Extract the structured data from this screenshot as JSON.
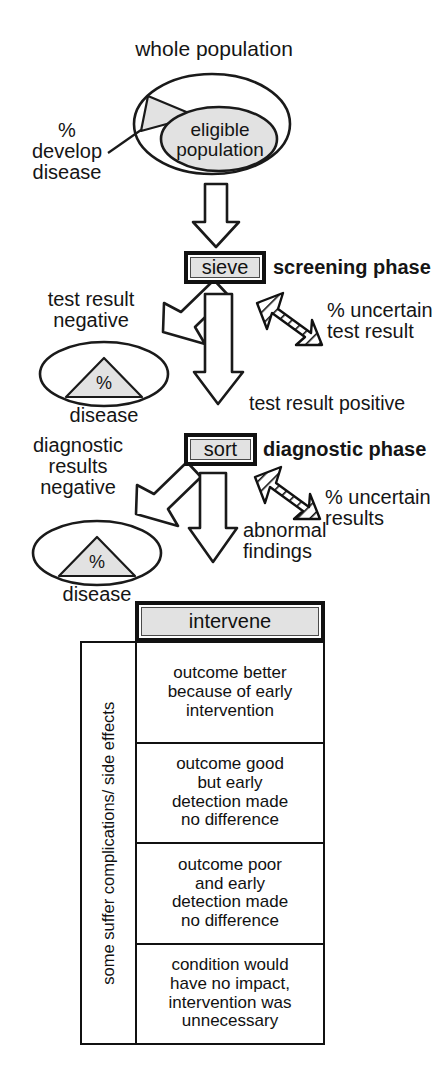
{
  "diagram": {
    "title_label": "whole population",
    "population": {
      "outer_label": "whole population",
      "inner_label": "eligible\npopulation",
      "wedge_label": "%\ndevelop\ndisease",
      "shade_color": "#e2e2e2"
    },
    "screening": {
      "box_label": "sieve",
      "phase_label": "screening phase",
      "negative_label": "test result\nnegative",
      "negative_ellipse_percent": "%",
      "negative_ellipse_caption": "disease",
      "uncertain_label": "% uncertain\ntest result",
      "positive_label": "test result positive"
    },
    "diagnostic": {
      "box_label": "sort",
      "phase_label": "diagnostic phase",
      "negative_label": "diagnostic\nresults\nnegative",
      "negative_ellipse_percent": "%",
      "negative_ellipse_caption": "disease",
      "uncertain_label": "% uncertain\nresults",
      "positive_label": "abnormal\nfindings"
    },
    "intervention": {
      "box_label": "intervene",
      "side_label": "some suffer complications/\nside effects",
      "outcomes": [
        "outcome better\nbecause of early\nintervention",
        "outcome good\nbut early\ndetection made\nno difference",
        "outcome poor\nand early\ndetection made\nno difference",
        "condition would\nhave no impact,\nintervention was\nunnecessary"
      ]
    },
    "colors": {
      "stroke": "#111111",
      "shade": "#e2e2e2",
      "background": "#ffffff"
    }
  }
}
